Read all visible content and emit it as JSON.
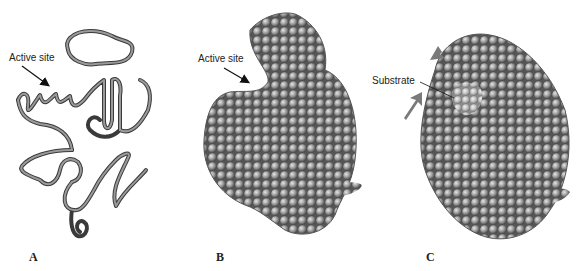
{
  "figure": {
    "panels": [
      {
        "letter": "A",
        "annotation": "Active site",
        "style": "ribbon"
      },
      {
        "letter": "B",
        "annotation": "Active site",
        "style": "space-filling"
      },
      {
        "letter": "C",
        "annotation": "Substrate",
        "style": "space-filling with substrate bound"
      }
    ],
    "colors": {
      "ribbon": "#8a8a8a",
      "ribbon_edge": "#3a3a3a",
      "atom_fill": "#9a9a9a",
      "atom_shadow": "#4a4a4a",
      "substrate": "#bdbdbd",
      "arrow": "#7a7a7a"
    }
  }
}
